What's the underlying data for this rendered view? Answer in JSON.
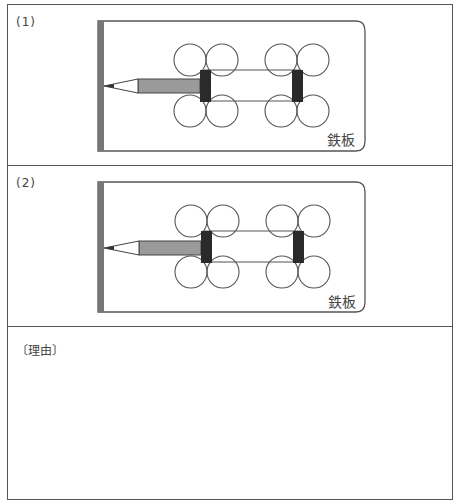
{
  "panels": [
    {
      "label": "(1)",
      "plate_label": "鉄板",
      "description": "Pencil attached to left axle of a four-wheel magnet cart on an iron plate; pencil tip points at left wall bar"
    },
    {
      "label": "(2)",
      "plate_label": "鉄板",
      "description": "Pencil attached to left axle of a four-wheel magnet cart on an iron plate; pencil tip points at left wall bar"
    }
  ],
  "reason": {
    "label": "〔理由〕",
    "answer": ""
  },
  "colors": {
    "border": "#555555",
    "wall_bar": "#777777",
    "pencil_body": "#9a9a9a",
    "magnet_block": "#2a2a2a",
    "line": "#555555"
  }
}
